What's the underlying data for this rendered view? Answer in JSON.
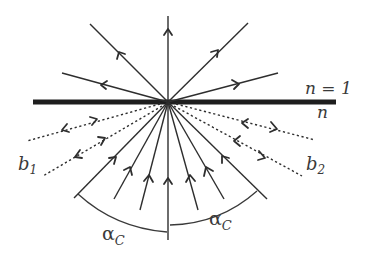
{
  "diagram": {
    "colors": {
      "ink": "#2e2e2e",
      "surface": "#1e1e1e",
      "background": "#ffffff"
    },
    "interface": {
      "label_above": "n = 1",
      "label_below": "n",
      "from": [
        33,
        102
      ],
      "to": [
        336,
        102
      ]
    },
    "origin": [
      168,
      102
    ],
    "refracted_rays": [
      {
        "name": "upper-left-steep",
        "end": [
          90,
          24
        ],
        "arrow_t": 0.52
      },
      {
        "name": "upper-left-shallow",
        "end": [
          62,
          73
        ],
        "arrow_t": 0.55
      },
      {
        "name": "vertical",
        "end": [
          168,
          16
        ],
        "arrow_t": 0.78
      },
      {
        "name": "upper-right-steep",
        "end": [
          248,
          23
        ],
        "arrow_t": 0.62
      },
      {
        "name": "upper-right-shallow",
        "end": [
          278,
          73
        ],
        "arrow_t": 0.62
      }
    ],
    "incident_rays": [
      {
        "name": "critical-left",
        "start": [
          74,
          198
        ],
        "arrow_t": 0.4
      },
      {
        "name": "incident-1",
        "start": [
          114,
          199
        ],
        "arrow_t": 0.4
      },
      {
        "name": "incident-2",
        "start": [
          140,
          210
        ],
        "arrow_t": 0.4
      },
      {
        "name": "incident-normal",
        "start": [
          168,
          240
        ],
        "arrow_t": 0.42
      },
      {
        "name": "incident-3",
        "start": [
          198,
          210
        ],
        "arrow_t": 0.4
      },
      {
        "name": "incident-4",
        "start": [
          224,
          199
        ],
        "arrow_t": 0.4
      },
      {
        "name": "critical-right",
        "start": [
          267,
          199
        ],
        "arrow_t": 0.4
      }
    ],
    "reflected_beams": [
      {
        "name": "b1-upper",
        "end": [
          27,
          141
        ]
      },
      {
        "name": "b1-lower",
        "end": [
          43,
          176
        ]
      },
      {
        "name": "b2-upper",
        "end": [
          315,
          140
        ]
      },
      {
        "name": "b2-lower",
        "end": [
          302,
          176
        ]
      }
    ],
    "labels": {
      "b1": {
        "main": "b",
        "sub": "1"
      },
      "b2": {
        "main": "b",
        "sub": "2"
      },
      "alpha_left": {
        "main": "α",
        "sub": "C"
      },
      "alpha_right": {
        "main": "α",
        "sub": "C"
      }
    }
  }
}
